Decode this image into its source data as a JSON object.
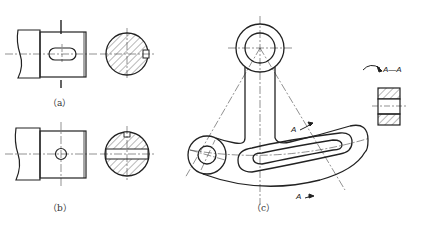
{
  "figures": {
    "a": {
      "caption": "（a）"
    },
    "b": {
      "caption": "（b）"
    },
    "c": {
      "caption": "（c）"
    }
  },
  "section_labels": {
    "cut_top": "A",
    "cut_bottom": "A",
    "view_title": "A—A"
  },
  "colors": {
    "line": "#222222",
    "hatch": "#333333",
    "background": "#ffffff"
  }
}
